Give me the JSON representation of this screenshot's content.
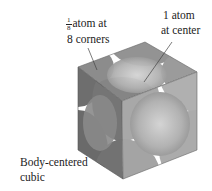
{
  "diagram": {
    "type": "crystal-unit-cell",
    "name": "Body-centered cubic",
    "labels": {
      "corner": {
        "fraction_numerator": "1",
        "fraction_denominator": "8",
        "line1_rest": "atom at",
        "line2": "8 corners"
      },
      "center": {
        "line1": "1 atom",
        "line2": "at center"
      },
      "caption": {
        "line1": "Body-centered",
        "line2": "cubic"
      }
    },
    "colors": {
      "top_face": "#8a8a8a",
      "left_face": "#6f6f6f",
      "right_face": "#a9a9a9",
      "center_sphere": "#b8b8b8",
      "gap": "#ffffff",
      "edge": "#555555",
      "leader_line": "#444444"
    }
  }
}
